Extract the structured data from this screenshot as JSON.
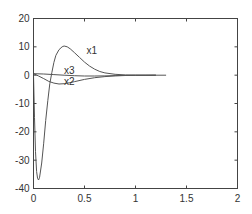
{
  "chart_data": {
    "type": "line",
    "title": "",
    "xlabel": "",
    "ylabel": "",
    "xlim": [
      0,
      2
    ],
    "ylim": [
      -40,
      20
    ],
    "grid": false,
    "legend": "inline labels",
    "xticks": [
      0,
      0.5,
      1,
      1.5,
      2
    ],
    "xtick_labels": [
      "0",
      "0.5",
      "1",
      "1.5",
      "2"
    ],
    "yticks": [
      -40,
      -30,
      -20,
      -10,
      0,
      10,
      20
    ],
    "ytick_labels": [
      "-40",
      "-30",
      "-20",
      "-10",
      "0",
      "10",
      "20"
    ],
    "series": [
      {
        "name": "x1",
        "label_pos": [
          0.52,
          7.5
        ],
        "x": [
          0,
          0.01,
          0.02,
          0.03,
          0.04,
          0.05,
          0.06,
          0.08,
          0.1,
          0.12,
          0.14,
          0.16,
          0.18,
          0.2,
          0.22,
          0.25,
          0.28,
          0.3,
          0.33,
          0.36,
          0.4,
          0.45,
          0.5,
          0.55,
          0.6,
          0.65,
          0.7,
          0.8,
          0.9,
          1.0,
          1.1,
          1.2,
          1.3
        ],
        "values": [
          0,
          -15,
          -27,
          -34,
          -36.5,
          -37,
          -36,
          -31,
          -24,
          -16,
          -9,
          -3,
          1,
          4.5,
          7,
          9,
          10,
          10.3,
          10,
          9.3,
          8,
          6.3,
          4.6,
          3.2,
          2.1,
          1.3,
          0.8,
          0.3,
          0.1,
          0.03,
          0,
          0,
          0
        ]
      },
      {
        "name": "x2",
        "label_pos": [
          0.3,
          -3.5
        ],
        "x": [
          0,
          0.05,
          0.1,
          0.15,
          0.2,
          0.25,
          0.3,
          0.35,
          0.4,
          0.5,
          0.6,
          0.7,
          0.8,
          0.9,
          1.0,
          1.2
        ],
        "values": [
          0.5,
          -0.3,
          -1.2,
          -2.2,
          -2.8,
          -3.1,
          -3.0,
          -2.7,
          -2.3,
          -1.5,
          -0.9,
          -0.5,
          -0.25,
          -0.1,
          -0.05,
          0
        ]
      },
      {
        "name": "x3",
        "label_pos": [
          0.3,
          0.4
        ],
        "x": [
          0,
          0.1,
          0.2,
          0.3,
          0.4,
          0.5,
          0.6,
          0.7,
          0.8,
          1.0,
          1.2
        ],
        "values": [
          0.5,
          0.4,
          0.2,
          0.0,
          -0.2,
          -0.3,
          -0.3,
          -0.25,
          -0.15,
          -0.05,
          0
        ]
      }
    ]
  },
  "colors": {
    "axis": "#444444",
    "line": "#555555",
    "text": "#333333",
    "background": "#ffffff"
  }
}
